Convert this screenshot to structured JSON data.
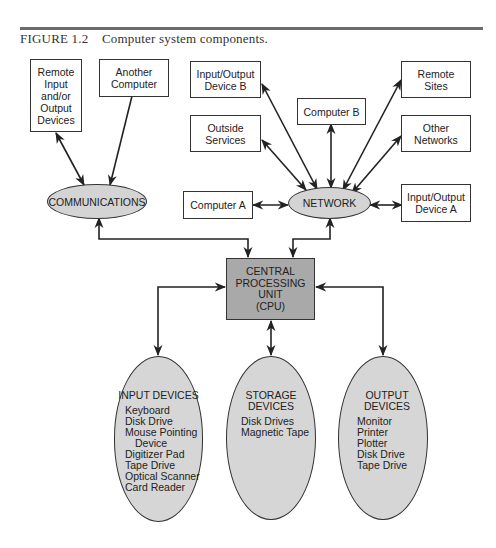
{
  "caption": {
    "number": "FIGURE 1.2",
    "title": "Computer system components."
  },
  "diagram": {
    "top_left_boxes": [
      {
        "id": "remote-io",
        "lines": [
          "Remote",
          "Input",
          "and/or",
          "Output",
          "Devices"
        ]
      },
      {
        "id": "another-computer",
        "lines": [
          "Another",
          "Computer"
        ]
      }
    ],
    "network_boxes": [
      {
        "id": "io-device-b",
        "lines": [
          "Input/Output",
          "Device B"
        ]
      },
      {
        "id": "computer-b",
        "lines": [
          "Computer B"
        ]
      },
      {
        "id": "remote-sites",
        "lines": [
          "Remote",
          "Sites"
        ]
      },
      {
        "id": "outside-services",
        "lines": [
          "Outside",
          "Services"
        ]
      },
      {
        "id": "other-networks",
        "lines": [
          "Other",
          "Networks"
        ]
      },
      {
        "id": "computer-a",
        "lines": [
          "Computer A"
        ]
      },
      {
        "id": "io-device-a",
        "lines": [
          "Input/Output",
          "Device A"
        ]
      }
    ],
    "hubs": {
      "communications": "COMMUNICATIONS",
      "network": "NETWORK"
    },
    "cpu": {
      "lines": [
        "CENTRAL",
        "PROCESSING",
        "UNIT",
        "(CPU)"
      ]
    },
    "devices": {
      "input": {
        "title": "INPUT DEVICES",
        "items": [
          "Keyboard",
          "Disk Drive",
          "Mouse Pointing",
          "Device",
          "Digitizer Pad",
          "Tape Drive",
          "Optical Scanner",
          "Card Reader"
        ]
      },
      "storage": {
        "title_lines": [
          "STORAGE",
          "DEVICES"
        ],
        "items": [
          "Disk Drives",
          "Magnetic Tape"
        ]
      },
      "output": {
        "title_lines": [
          "OUTPUT",
          "DEVICES"
        ],
        "items": [
          "Monitor",
          "Printer",
          "Plotter",
          "Disk Drive",
          "Tape Drive"
        ]
      }
    },
    "colors": {
      "hub_fill": "#d4d4d4",
      "cpu_fill": "#a9a9a9",
      "capsule_fill": "#d6d6d6",
      "stroke": "#333333"
    }
  }
}
